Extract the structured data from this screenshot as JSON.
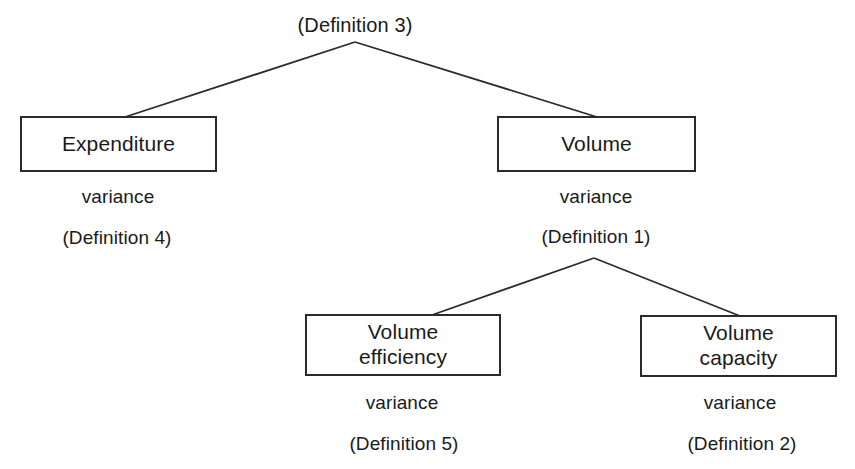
{
  "diagram": {
    "title_visible": false,
    "background_color": "#ffffff",
    "line_color": "#2b2b2b",
    "text_color": "#1a1a1a",
    "root": {
      "apex_caption": "(Definition 3)"
    },
    "nodes": {
      "expenditure": {
        "label_line1": "Expenditure",
        "label_line2": "",
        "caption_variance": "variance",
        "caption_definition": "(Definition 4)"
      },
      "volume": {
        "label_line1": "Volume",
        "label_line2": "",
        "caption_variance": "variance",
        "caption_definition": "(Definition 1)"
      },
      "volume_efficiency": {
        "label_line1": "Volume",
        "label_line2": "efficiency",
        "caption_variance": "variance",
        "caption_definition": "(Definition 5)"
      },
      "volume_capacity": {
        "label_line1": "Volume",
        "label_line2": "capacity",
        "caption_variance": "variance",
        "caption_definition": "(Definition 2)"
      }
    }
  }
}
